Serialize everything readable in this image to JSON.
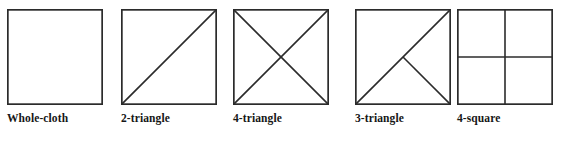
{
  "plate": {
    "background_color": "#ffffff",
    "stroke_color": "#2b2b2b",
    "label_color": "#161616",
    "figure_count": 5
  },
  "figures": [
    {
      "label": "Whole-cloth",
      "pattern": "whole-cloth",
      "x": 7,
      "divisions": 1,
      "internal_lines": []
    },
    {
      "label": "2-triangle",
      "pattern": "2-triangle",
      "x": 121,
      "divisions": 2,
      "internal_lines": [
        "diagonal-bottomleft-to-topright"
      ]
    },
    {
      "label": "4-triangle",
      "pattern": "4-triangle",
      "x": 233,
      "divisions": 4,
      "internal_lines": [
        "diagonal-bottomleft-to-topright",
        "diagonal-topleft-to-bottomright"
      ]
    },
    {
      "label": "3-triangle",
      "pattern": "3-triangle",
      "x": 355,
      "divisions": 3,
      "internal_lines": [
        "diagonal-bottomleft-to-topright",
        "half-diagonal-bottomright-to-center"
      ]
    },
    {
      "label": "4-square",
      "pattern": "4-square",
      "x": 457,
      "divisions": 4,
      "internal_lines": [
        "vertical-center",
        "horizontal-center"
      ]
    }
  ]
}
